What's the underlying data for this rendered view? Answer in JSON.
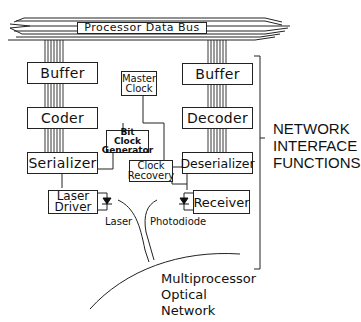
{
  "bus": {
    "label": "Processor Data Bus"
  },
  "transmit_chain": {
    "buffer": "Buffer",
    "coder": "Coder",
    "serializer": "Serializer",
    "laser_driver_line1": "Laser",
    "laser_driver_line2": "Driver",
    "laser_label": "Laser"
  },
  "receive_chain": {
    "buffer": "Buffer",
    "decoder": "Decoder",
    "deserializer": "Deserializer",
    "receiver": "Receiver",
    "photodiode_label": "Photodiode"
  },
  "clocking": {
    "master_clock_line1": "Master",
    "master_clock_line2": "Clock",
    "bit_clock_line1": "Bit Clock",
    "bit_clock_line2": "Generator",
    "clock_recovery_line1": "Clock",
    "clock_recovery_line2": "Recovery"
  },
  "bracket_label": {
    "line1": "NETWORK",
    "line2": "INTERFACE",
    "line3": "FUNCTIONS"
  },
  "network": {
    "line1": "Multiprocessor",
    "line2": "Optical",
    "line3": "Network"
  },
  "colors": {
    "line": "#222222",
    "background": "#ffffff"
  }
}
